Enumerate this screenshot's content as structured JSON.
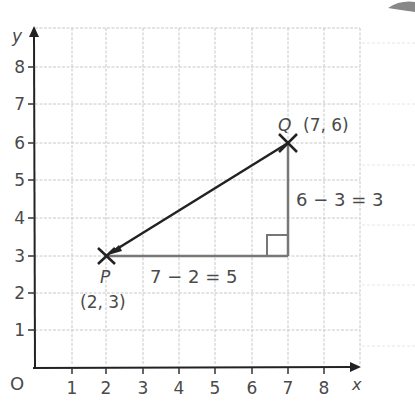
{
  "axes": {
    "x_label": "x",
    "y_label": "y",
    "origin_label": "O",
    "x_ticks": [
      "1",
      "2",
      "3",
      "4",
      "5",
      "6",
      "7",
      "8"
    ],
    "y_ticks": [
      "1",
      "2",
      "3",
      "4",
      "5",
      "6",
      "7",
      "8"
    ]
  },
  "points": {
    "P": {
      "name": "P",
      "coords": "(2, 3)",
      "x": 2,
      "y": 3
    },
    "Q": {
      "name": "Q",
      "coords": "(7, 6)",
      "x": 7,
      "y": 6
    }
  },
  "annotations": {
    "horizontal": "7 − 2 = 5",
    "vertical": "6 − 3 = 3"
  },
  "colors": {
    "grid": "#c8c8c8",
    "axis": "#222222",
    "segment": "#222222",
    "legs": "#777777",
    "text": "#4a4a4a"
  }
}
